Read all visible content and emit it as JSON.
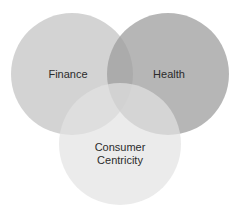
{
  "diagram": {
    "type": "venn",
    "sets": [
      {
        "id": "finance",
        "label": "Finance",
        "cx": 72,
        "cy": 74,
        "r": 61,
        "color": "#c4c4c4",
        "opacity": 0.75,
        "label_x": 68,
        "label_y": 78
      },
      {
        "id": "health",
        "label": "Health",
        "cx": 168,
        "cy": 74,
        "r": 61,
        "color": "#9e9e9e",
        "opacity": 0.75,
        "label_x": 169,
        "label_y": 78
      },
      {
        "id": "consumer",
        "label_line1": "Consumer",
        "label_line2": "Centricity",
        "cx": 120,
        "cy": 144,
        "r": 61,
        "color": "#e2e2e2",
        "opacity": 0.7,
        "label_x": 120,
        "label_y1": 151,
        "label_y2": 164
      }
    ]
  }
}
